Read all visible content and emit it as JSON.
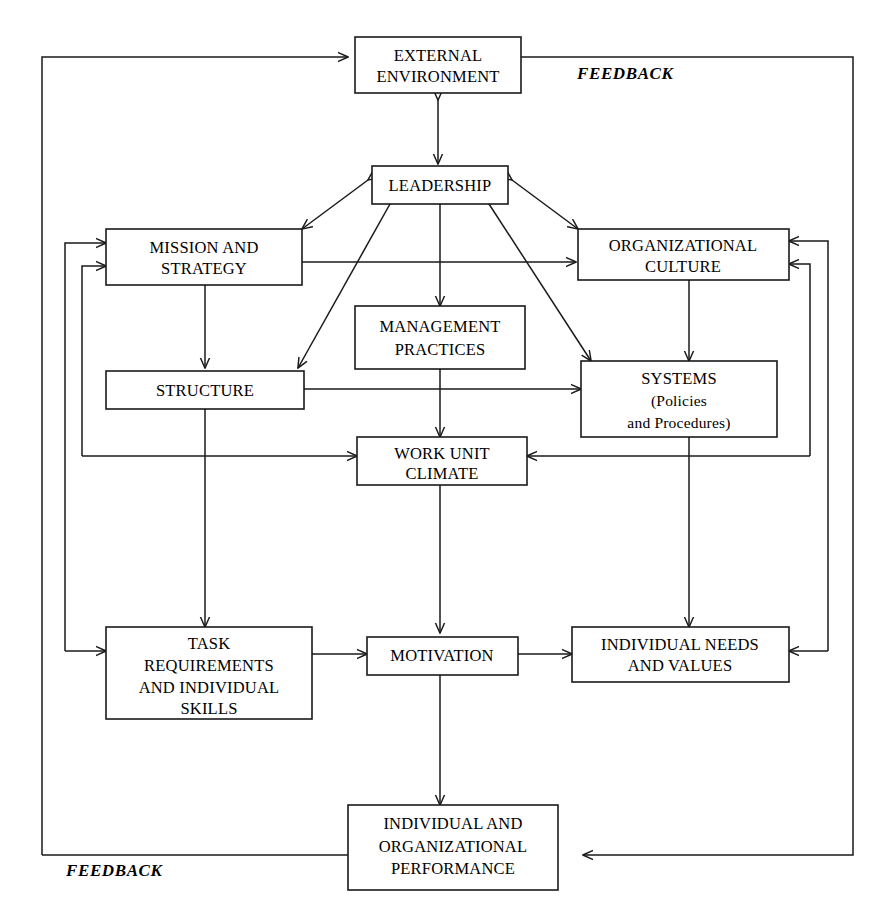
{
  "diagram": {
    "type": "flow-diagram",
    "background_color": "#ffffff",
    "line_color": "#1a1a1a",
    "nodes": {
      "external_environment": {
        "lines": [
          "EXTERNAL",
          "ENVIRONMENT"
        ]
      },
      "leadership": {
        "lines": [
          "LEADERSHIP"
        ]
      },
      "mission_and_strategy": {
        "lines": [
          "MISSION AND",
          "STRATEGY"
        ]
      },
      "organizational_culture": {
        "lines": [
          "ORGANIZATIONAL",
          "CULTURE"
        ]
      },
      "management_practices": {
        "lines": [
          "MANAGEMENT",
          "PRACTICES"
        ]
      },
      "structure": {
        "lines": [
          "STRUCTURE"
        ]
      },
      "systems": {
        "lines": [
          "SYSTEMS",
          "(Policies",
          "and Procedures)"
        ]
      },
      "work_unit_climate": {
        "lines": [
          "WORK UNIT",
          "CLIMATE"
        ]
      },
      "task_requirements": {
        "lines": [
          "TASK",
          "REQUIREMENTS",
          "AND INDIVIDUAL",
          "SKILLS"
        ]
      },
      "motivation": {
        "lines": [
          "MOTIVATION"
        ]
      },
      "individual_needs": {
        "lines": [
          "INDIVIDUAL NEEDS",
          "AND VALUES"
        ]
      },
      "performance": {
        "lines": [
          "INDIVIDUAL AND",
          "ORGANIZATIONAL",
          "PERFORMANCE"
        ]
      }
    },
    "annotations": {
      "feedback_top": "FEEDBACK",
      "feedback_bottom": "FEEDBACK"
    }
  }
}
